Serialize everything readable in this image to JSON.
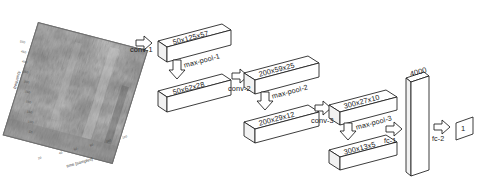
{
  "figure": {
    "type": "cnn-architecture-diagram",
    "background_color": "#ffffff",
    "line_color": "#1a1a1a"
  },
  "input": {
    "name": "spectrogram",
    "xlabel": "time [samples]",
    "ylabel": "frequency",
    "xticks": [
      "20",
      "40",
      "60",
      "80",
      "100",
      "120"
    ],
    "yticks": [
      "500",
      "450",
      "400",
      "350",
      "300",
      "250",
      "200",
      "150",
      "100",
      "50"
    ]
  },
  "layers": [
    {
      "id": "conv1-out",
      "label": "50x125x57",
      "op": "conv-1"
    },
    {
      "id": "pool1-out",
      "label": "50x62x28",
      "op": "max-pool-1"
    },
    {
      "id": "conv2-out",
      "label": "200x59x25",
      "op": "conv-2"
    },
    {
      "id": "pool2-out",
      "label": "200x29x12",
      "op": "max-pool-2"
    },
    {
      "id": "conv3-out",
      "label": "300x27x10",
      "op": "conv-3"
    },
    {
      "id": "pool3-out",
      "label": "300x13x5",
      "op": "max-pool-3"
    },
    {
      "id": "fc1-out",
      "label": "4000",
      "op": "fc-1"
    },
    {
      "id": "fc2-out",
      "label": "1",
      "op": "fc-2"
    }
  ],
  "operations": {
    "conv1": "conv-1",
    "maxpool1": "max-pool-1",
    "conv2": "conv-2",
    "maxpool2": "max-pool-2",
    "conv3": "conv-3",
    "maxpool3": "max-pool-3",
    "fc1": "fc-1",
    "fc2": "fc-2"
  },
  "dimensions": {
    "conv1_out": "50x125x57",
    "pool1_out": "50x62x28",
    "conv2_out": "200x59x25",
    "pool2_out": "200x29x12",
    "conv3_out": "300x27x10",
    "pool3_out": "300x13x5",
    "fc1_units": "4000",
    "fc2_units": "1"
  }
}
